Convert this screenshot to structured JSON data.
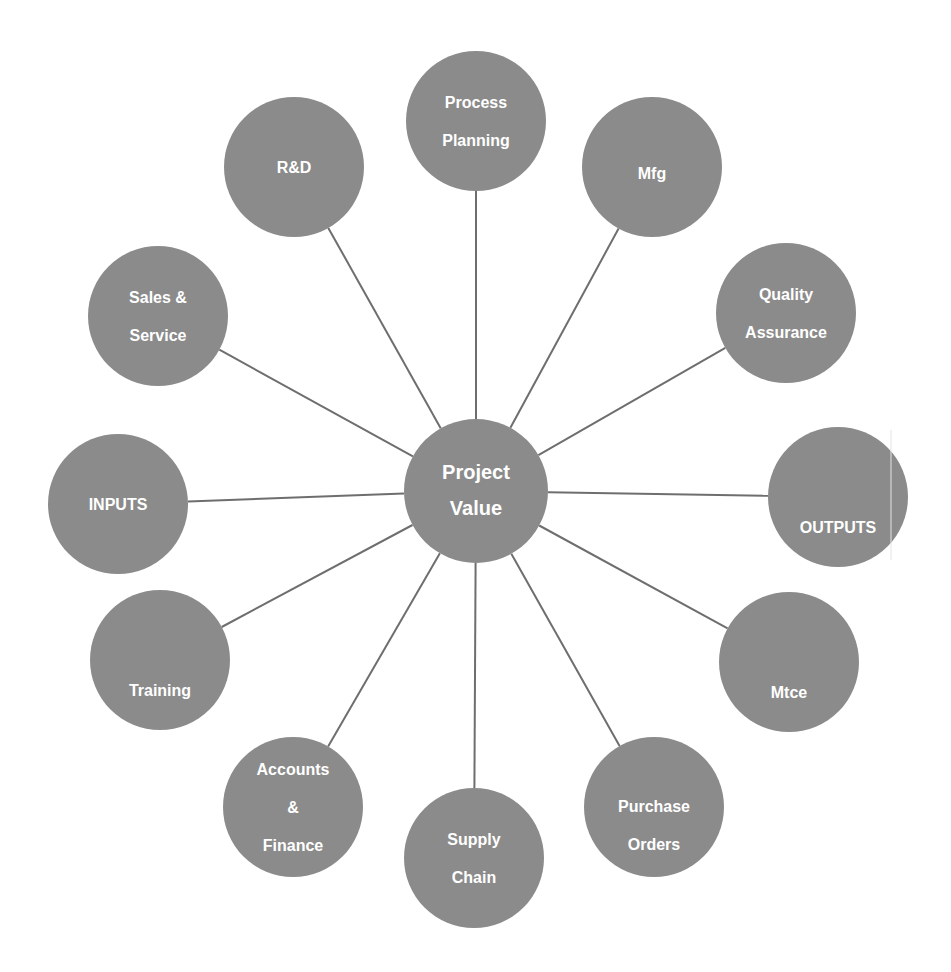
{
  "diagram": {
    "type": "hub-and-spoke",
    "colors": {
      "node_fill": "#8b8b8b",
      "spoke": "#6e6e6e",
      "label": "#ffffff",
      "background": "#ffffff"
    },
    "hub": {
      "label_lines": [
        "Project",
        "Value"
      ],
      "cx": 476,
      "cy": 491,
      "r": 72
    },
    "nodes": [
      {
        "id": "process-planning",
        "label_lines": [
          "Process",
          "Planning"
        ],
        "cx": 476,
        "cy": 121,
        "r": 70
      },
      {
        "id": "mfg",
        "label_lines": [
          "Mfg"
        ],
        "cx": 652,
        "cy": 167,
        "r": 70,
        "label_dy": 6
      },
      {
        "id": "quality-assurance",
        "label_lines": [
          "Quality",
          "Assurance"
        ],
        "cx": 786,
        "cy": 313,
        "r": 70
      },
      {
        "id": "outputs",
        "label_lines": [
          "OUTPUTS"
        ],
        "cx": 838,
        "cy": 497,
        "r": 70,
        "label_dy": 30
      },
      {
        "id": "mtce",
        "label_lines": [
          "Mtce"
        ],
        "cx": 789,
        "cy": 662,
        "r": 70,
        "label_dy": 30
      },
      {
        "id": "purchase-orders",
        "label_lines": [
          "Purchase",
          "Orders"
        ],
        "cx": 654,
        "cy": 807,
        "r": 70,
        "label_dy": 18
      },
      {
        "id": "supply-chain",
        "label_lines": [
          "Supply",
          "Chain"
        ],
        "cx": 474,
        "cy": 858,
        "r": 70
      },
      {
        "id": "accounts-finance",
        "label_lines": [
          "Accounts",
          "&",
          "Finance"
        ],
        "cx": 293,
        "cy": 807,
        "r": 70
      },
      {
        "id": "training",
        "label_lines": [
          "Training"
        ],
        "cx": 160,
        "cy": 660,
        "r": 70,
        "label_dy": 30
      },
      {
        "id": "inputs",
        "label_lines": [
          "INPUTS"
        ],
        "cx": 118,
        "cy": 504,
        "r": 70
      },
      {
        "id": "sales-service",
        "label_lines": [
          "Sales &",
          "Service"
        ],
        "cx": 158,
        "cy": 316,
        "r": 70
      },
      {
        "id": "r-and-d",
        "label_lines": [
          "R&D"
        ],
        "cx": 294,
        "cy": 167,
        "r": 70
      }
    ]
  }
}
